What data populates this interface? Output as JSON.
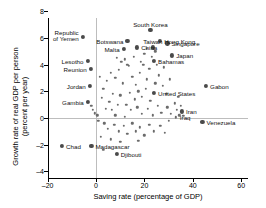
{
  "chart_data": {
    "type": "scatter",
    "title": "",
    "xlabel": "Saving rate (percentage of GDP)",
    "ylabel_line1": "Growth rate of real GDP per person",
    "ylabel_line2": "(percent per year)",
    "xlim": [
      -28,
      70
    ],
    "ylim": [
      -4,
      8.6
    ],
    "xticks": [
      -20,
      0,
      20,
      40,
      60
    ],
    "xticklabels": [
      "–20",
      "0",
      "20",
      "40",
      "60"
    ],
    "yticks": [
      8,
      6,
      4,
      2,
      0,
      -2,
      -4
    ],
    "yticklabels": [
      "8",
      "6",
      "4",
      "2",
      "0",
      "–2",
      "–4"
    ],
    "grid": "zero-lines-only",
    "legend": "none",
    "labeled_points": [
      {
        "name": "Republic\nof Yemen",
        "label": "Republic of Yemen",
        "label_l1": "Republic",
        "label_l2": "of Yemen",
        "x": -5.5,
        "y": 6.1,
        "anchor": "left",
        "size": "big"
      },
      {
        "name": "Lesotho",
        "label": "Lesotho",
        "x": -3.5,
        "y": 4.3,
        "anchor": "left",
        "size": "big"
      },
      {
        "name": "Reunion",
        "label": "Reunion",
        "x": -2.2,
        "y": 3.7,
        "anchor": "left",
        "size": "big"
      },
      {
        "name": "Jordan",
        "label": "Jordan",
        "x": -2.6,
        "y": 2.4,
        "anchor": "left",
        "size": "big"
      },
      {
        "name": "Gambia",
        "label": "Gambia",
        "x": -3.4,
        "y": 1.2,
        "anchor": "left",
        "size": "big"
      },
      {
        "name": "Chad",
        "label": "Chad",
        "x": -14.0,
        "y": -2.1,
        "anchor": "right",
        "size": "big"
      },
      {
        "name": "Madagascar",
        "label": "Madagascar",
        "x": -1.9,
        "y": -2.1,
        "anchor": "right",
        "size": "big"
      },
      {
        "name": "Djibouti",
        "label": "Djibouti",
        "x": 8.6,
        "y": -2.7,
        "anchor": "right",
        "size": "big"
      },
      {
        "name": "Botswana",
        "label": "Botswana",
        "x": 13.0,
        "y": 5.8,
        "anchor": "left",
        "size": "big"
      },
      {
        "name": "Malta",
        "label": "Malta",
        "x": 11.4,
        "y": 5.2,
        "anchor": "left",
        "size": "big"
      },
      {
        "name": "China",
        "label": "China",
        "x": 17.0,
        "y": 5.3,
        "anchor": "right",
        "size": "big"
      },
      {
        "name": "South Korea",
        "label": "South Korea",
        "x": 22.5,
        "y": 6.6,
        "anchor": "center-above",
        "size": "big"
      },
      {
        "name": "Taiwan",
        "label": "Taiwan",
        "x": 23.5,
        "y": 5.3,
        "anchor": "center-above",
        "size": "big"
      },
      {
        "name": "Hong Kong",
        "label": "Hong Kong",
        "x": 26.5,
        "y": 5.8,
        "anchor": "right",
        "size": "big"
      },
      {
        "name": "Singapore",
        "label": "Singapore",
        "x": 29.5,
        "y": 5.6,
        "anchor": "right",
        "size": "big"
      },
      {
        "name": "Japan",
        "label": "Japan",
        "x": 31.5,
        "y": 4.7,
        "anchor": "right",
        "size": "big"
      },
      {
        "name": "Bahamas",
        "label": "Bahamas",
        "x": 24.0,
        "y": 4.3,
        "anchor": "right",
        "size": "big"
      },
      {
        "name": "United States",
        "label": "United States",
        "x": 24.0,
        "y": 1.9,
        "anchor": "right",
        "size": "big"
      },
      {
        "name": "Iran",
        "label": "Iran",
        "x": 35.5,
        "y": 0.5,
        "anchor": "right",
        "size": "big"
      },
      {
        "name": "Iraq",
        "label": "Iraq",
        "x": 33.0,
        "y": 0.05,
        "anchor": "right",
        "size": "small"
      },
      {
        "name": "Venezuela",
        "label": "Venezuela",
        "x": 44.0,
        "y": -0.3,
        "anchor": "right",
        "size": "big"
      },
      {
        "name": "Gabon",
        "label": "Gabon",
        "x": 45.5,
        "y": 2.4,
        "anchor": "right",
        "size": "big"
      }
    ],
    "unlabeled_points": [
      {
        "x": -2.0,
        "y": 0.9
      },
      {
        "x": -1.2,
        "y": 0.6
      },
      {
        "x": -0.6,
        "y": 0.35
      },
      {
        "x": 1.5,
        "y": 3.1
      },
      {
        "x": 4.5,
        "y": 2.8
      },
      {
        "x": 3.0,
        "y": 2.2
      },
      {
        "x": 6.0,
        "y": 3.4
      },
      {
        "x": 8.0,
        "y": 3.0
      },
      {
        "x": 9.5,
        "y": 3.6
      },
      {
        "x": 11.0,
        "y": 2.6
      },
      {
        "x": 13.5,
        "y": 3.9
      },
      {
        "x": 12.0,
        "y": 4.4
      },
      {
        "x": 15.0,
        "y": 3.1
      },
      {
        "x": 16.5,
        "y": 2.5
      },
      {
        "x": 18.0,
        "y": 3.4
      },
      {
        "x": 19.5,
        "y": 4.0
      },
      {
        "x": 21.0,
        "y": 2.9
      },
      {
        "x": 22.0,
        "y": 3.7
      },
      {
        "x": 14.0,
        "y": 1.9
      },
      {
        "x": 16.0,
        "y": 1.4
      },
      {
        "x": 17.5,
        "y": 2.0
      },
      {
        "x": 19.0,
        "y": 1.6
      },
      {
        "x": 20.5,
        "y": 2.2
      },
      {
        "x": 22.5,
        "y": 1.3
      },
      {
        "x": 24.5,
        "y": 2.6
      },
      {
        "x": 26.0,
        "y": 3.2
      },
      {
        "x": 27.5,
        "y": 2.4
      },
      {
        "x": 29.0,
        "y": 1.8
      },
      {
        "x": 30.5,
        "y": 2.9
      },
      {
        "x": 28.0,
        "y": 3.8
      },
      {
        "x": 25.0,
        "y": 4.0
      },
      {
        "x": 23.0,
        "y": 4.6
      },
      {
        "x": 20.0,
        "y": 4.8
      },
      {
        "x": 18.5,
        "y": 4.2
      },
      {
        "x": 15.5,
        "y": 4.6
      },
      {
        "x": 13.0,
        "y": 4.0
      },
      {
        "x": 10.5,
        "y": 4.2
      },
      {
        "x": 8.5,
        "y": 4.5
      },
      {
        "x": 7.0,
        "y": 1.8
      },
      {
        "x": 5.5,
        "y": 1.2
      },
      {
        "x": 4.0,
        "y": 0.7
      },
      {
        "x": 2.5,
        "y": 1.5
      },
      {
        "x": 6.5,
        "y": 0.6
      },
      {
        "x": 9.0,
        "y": 1.0
      },
      {
        "x": 10.0,
        "y": 1.7
      },
      {
        "x": 12.5,
        "y": 1.0
      },
      {
        "x": 14.5,
        "y": 0.6
      },
      {
        "x": 17.0,
        "y": 0.8
      },
      {
        "x": 19.0,
        "y": 0.3
      },
      {
        "x": 21.5,
        "y": 0.7
      },
      {
        "x": 23.5,
        "y": 0.2
      },
      {
        "x": 25.5,
        "y": 0.9
      },
      {
        "x": 27.0,
        "y": 0.4
      },
      {
        "x": 29.5,
        "y": 0.8
      },
      {
        "x": 31.0,
        "y": 0.3
      },
      {
        "x": 32.5,
        "y": 1.1
      },
      {
        "x": 34.0,
        "y": 1.6
      },
      {
        "x": 33.5,
        "y": 0.6
      },
      {
        "x": 34.5,
        "y": 0.2
      },
      {
        "x": 35.0,
        "y": 0.9
      },
      {
        "x": 36.0,
        "y": 0.15
      },
      {
        "x": 3.5,
        "y": -0.4
      },
      {
        "x": 5.0,
        "y": -0.8
      },
      {
        "x": 7.5,
        "y": -0.5
      },
      {
        "x": 9.5,
        "y": -1.0
      },
      {
        "x": 11.5,
        "y": -0.6
      },
      {
        "x": 13.0,
        "y": -1.2
      },
      {
        "x": 15.0,
        "y": -0.4
      },
      {
        "x": 16.5,
        "y": -1.0
      },
      {
        "x": 18.0,
        "y": -0.7
      },
      {
        "x": 20.0,
        "y": -1.3
      },
      {
        "x": 22.0,
        "y": -0.5
      },
      {
        "x": 24.0,
        "y": -1.0
      },
      {
        "x": 2.0,
        "y": -1.4
      },
      {
        "x": 1.0,
        "y": -0.2
      },
      {
        "x": 0.5,
        "y": 0.2
      },
      {
        "x": 26.5,
        "y": -0.6
      },
      {
        "x": 28.5,
        "y": -1.1
      },
      {
        "x": 12.0,
        "y": 0.1
      },
      {
        "x": 8.0,
        "y": 0.2
      },
      {
        "x": 30.0,
        "y": -0.2
      },
      {
        "x": 21.0,
        "y": 5.2
      },
      {
        "x": 24.5,
        "y": 5.0
      },
      {
        "x": 6.0,
        "y": -1.6
      },
      {
        "x": 10.0,
        "y": -1.8
      },
      {
        "x": 3.0,
        "y": -2.4
      },
      {
        "x": 17.5,
        "y": -1.7
      }
    ]
  }
}
